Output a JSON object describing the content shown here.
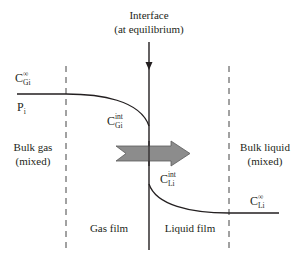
{
  "diagram": {
    "interface": {
      "label_line1": "Interface",
      "label_line2": "(at equilibrium)"
    },
    "regions": {
      "bulk_gas_line1": "Bulk gas",
      "bulk_gas_line2": "(mixed)",
      "gas_film": "Gas film",
      "liquid_film": "Liquid film",
      "bulk_liquid_line1": "Bulk liquid",
      "bulk_liquid_line2": "(mixed)"
    },
    "symbols": {
      "c_gi_bulk": {
        "base": "C",
        "sub": "Gi",
        "sup": "∞"
      },
      "p_i": {
        "base": "P",
        "sub": "i"
      },
      "c_gi_int": {
        "base": "C",
        "sub": "Gi",
        "sup": "int"
      },
      "c_li_int": {
        "base": "C",
        "sub": "Li",
        "sup": "int"
      },
      "c_li_bulk": {
        "base": "C",
        "sub": "Li",
        "sup": "∞"
      }
    },
    "transfer_arrow": {
      "direction": "gas-to-liquid",
      "fill_color": "#8c8c8c",
      "stroke_color": "#555555"
    },
    "colors": {
      "line": "#231f20",
      "dashed": "#444444",
      "background": "#ffffff"
    }
  }
}
